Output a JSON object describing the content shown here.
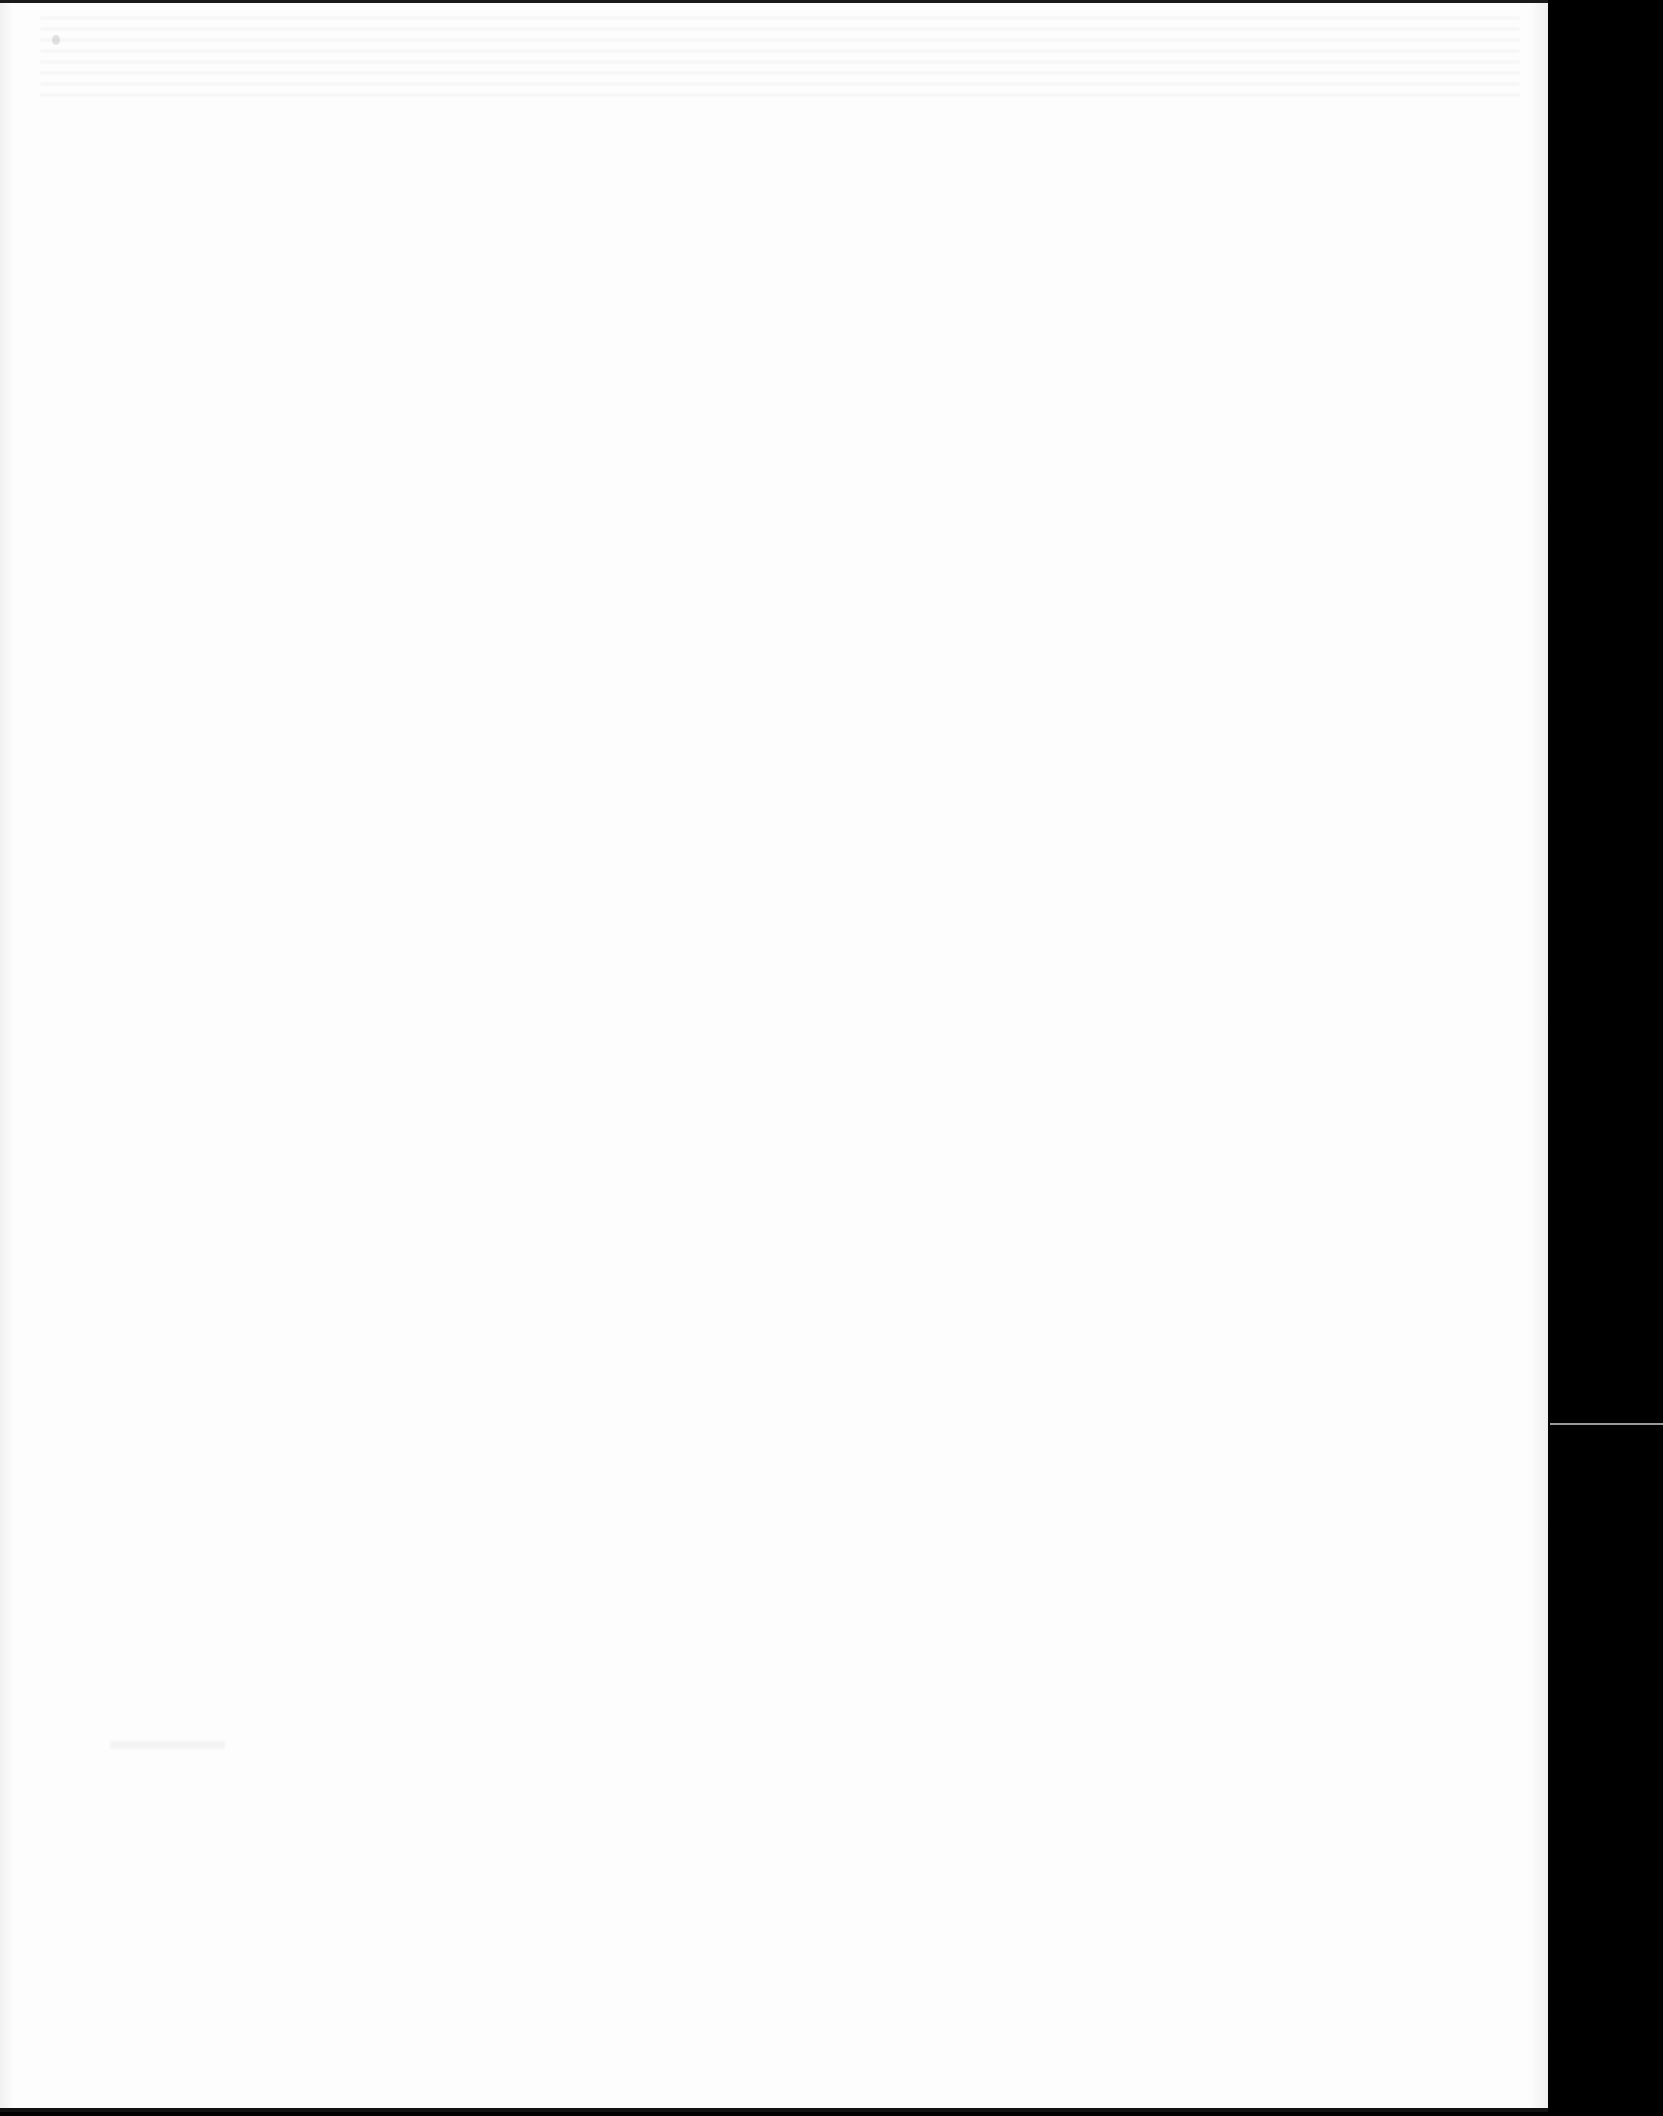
{
  "document": {
    "type": "scanned-page",
    "content_state": "blank",
    "visible_text": ""
  },
  "colors": {
    "paper": "#fdfdfd",
    "scanner_background": "#000000",
    "edge_line": "#9a9a9a"
  }
}
